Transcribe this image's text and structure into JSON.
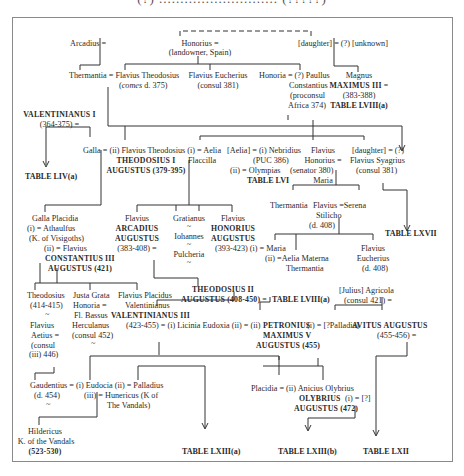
{
  "page": {
    "title_strip": "(?) ............................ (?????)",
    "colors": {
      "background": "#ffffff",
      "text": "#2a2a2a",
      "lines": "#333333",
      "frame": "#8a8a8a"
    }
  },
  "nodes": {
    "arcadius": "Arcadius =",
    "honorius_1": "Honorius =",
    "honorius_1_desc": "(landowner, Spain)",
    "daughter_top": "[daughter] = (?) [unknown]",
    "thermantia_1": "Thermantia = Flavius Theodosius",
    "theodosius_comes_pre": "(",
    "theodosius_comes_it": "comes",
    "theodosius_comes_post": " d. 375)",
    "eucherius_1": "Flavius Eucherius",
    "eucherius_1_desc": "(consul 381)",
    "honoria_paullus": "Honoria = (?) Paullus",
    "paullus_2": "Constantius",
    "paullus_3": "(proconsul",
    "paullus_4": "Africa 374)",
    "magnus": "Magnus",
    "maximus_iii": "MAXIMUS III =",
    "maximus_iii_dates": "(383-388)",
    "table_lviii_a_1": "TABLE LVIII(a)",
    "valentinianus_i": "VALENTINIANUS I",
    "valentinianus_i_dates": "(364-375) =",
    "table_liv_a": "TABLE LIV(a)",
    "galla_theodosius": "Galla = (ii) Flavius Theodosius (i) = Aelia",
    "theodosius_i": "THEODOSIUS I",
    "theodosius_i_aug": "AUGUSTUS (379-395)",
    "flaccilla": "Flaccilla",
    "aelia_nebridius": "[Aelia] = (i) Nebridius",
    "nebridius_puc": "(PUC 386)",
    "olympias": "(ii) = Olympias",
    "table_lvi": "TABLE LVI",
    "honorius_2": "Flavius",
    "honorius_2b": "Honorius =",
    "honorius_2c": "(senator 380)",
    "maria_1": "Maria",
    "daughter_2": "[daughter] = (?)",
    "syagrius": "Flavius Syagrius",
    "syagrius_desc": "(consul 381)",
    "table_lxvii": "TABLE LXVII",
    "thermantia_2": "Thermantia",
    "stilicho_1": "Flavius =Serena",
    "stilicho_2": "Stilicho",
    "stilicho_3": "(d. 408)",
    "galla_placidia": "Galla Placidia",
    "athaulfus": "(i) = Athaulfus",
    "athaulfus_k": "(K. of Visigoths)",
    "constantius_pre": "(ii) = Flavius",
    "constantius_iii": "CONSTANTIUS III",
    "constantius_aug": "AUGUSTUS (421)",
    "arcadius_2": "Flavius",
    "arcadius_2b": "ARCADIUS",
    "arcadius_2c": "AUGUSTUS",
    "arcadius_2d": "(383-408) =",
    "gratianus": "Gratianus",
    "tilde_1": "~",
    "iohannes": "Iohannes",
    "tilde_2": "~",
    "pulcheria": "Pulcheria",
    "tilde_3": "~",
    "honorius_3": "Flavius",
    "honorius_3b": "HONORIUS",
    "honorius_3c": "AUGUSTUS",
    "honorius_3d": "(393-423) (i) = Maria",
    "aelia_materna": "(ii) =Aelia Materna",
    "aelia_materna_2": "Thermantia",
    "eucherius_2": "Flavius",
    "eucherius_2b": "Eucherius",
    "eucherius_2c": "(d. 408)",
    "theodosius_child": "Theodosius",
    "theodosius_child_dates": "(414-415)",
    "tilde_4": "~",
    "justa_grata": "Justa Grata",
    "justa_2": "Honoria =",
    "justa_3": "Fl. Bassus",
    "justa_4": "Herculanus",
    "justa_5": "(consul 452)",
    "tilde_5": "~",
    "placidus": "Flavius Placidus",
    "placidus_2": "Valentinianus",
    "valentinianus_iii": "VALENTINIANUS III",
    "valentinianus_iii_line": "(423-455) = (i) Licinia Eudoxia (ii) = (ii)",
    "theodosius_ii": "THEODOSIUS II",
    "theodosius_ii_aug": "AUGUSTUS (408-450) =",
    "table_lviii_a_2": "TABLE LVIII(a)",
    "petronius": "PETRONIUS",
    "petronius_wife": "(i) = [?Palladia]",
    "maximus_v": "MAXIMUS V",
    "maximus_v_aug": "AUGUSTUS (455)",
    "agricola": "[Julius] Agricola",
    "agricola_desc": "(consul 421) =",
    "avitus": "AVITUS AUGUSTUS",
    "avitus_dates": "(455-456) =",
    "aetius_1": "Flavius",
    "aetius_2": "Aetius =",
    "aetius_3": "(consul",
    "aetius_4": "(iii) 446)",
    "gaudentius": "Gaudentius = (i) Eudocia (ii) = Palladius",
    "gaudentius_d": "(d. 454)",
    "hunericus": "(iii) = Hunericus (K of",
    "hunericus_2": "The Vandals)",
    "tilde_6": "~",
    "placidia_olybrius": "Placidia = (ii) Anicius Olybrius",
    "olybrius": "OLYBRIUS",
    "olybrius_wife": "(i) = [?]",
    "olybrius_aug": "AUGUSTUS (472)",
    "hildericus": "Hildericus",
    "hildericus_k": "K. of the Vandals",
    "hildericus_dates": "(523-530)",
    "table_lxiii_a": "TABLE LXIII(a)",
    "table_lxiii_b": "TABLE LXIII(b)",
    "table_lxii": "TABLE LXII"
  }
}
